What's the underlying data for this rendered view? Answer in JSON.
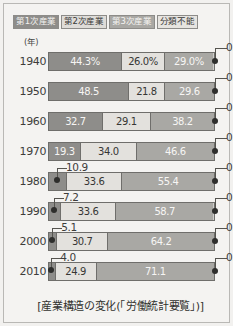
{
  "legend": {
    "items": [
      {
        "label": "第1次産業",
        "swatch_class": "sw-p1",
        "color": "#8e8d8a"
      },
      {
        "label": "第2次産業",
        "swatch_class": "sw-p2",
        "color": "#dedcd8"
      },
      {
        "label": "第3次産業",
        "swatch_class": "sw-p3",
        "color": "#a9a8a4"
      },
      {
        "label": "分類不能",
        "swatch_class": "sw-p4",
        "color": "#e6e4e0"
      }
    ]
  },
  "axis": {
    "year_unit_label": "(年)"
  },
  "caption": "[産業構造の変化(「労働統計要覧」)]",
  "chart_data": {
    "type": "bar",
    "orientation": "horizontal",
    "stacked": true,
    "normalized_percent": true,
    "title": "産業構造の変化(「労働統計要覧」)",
    "xlabel": "",
    "ylabel": "(年)",
    "xlim": [
      0,
      100
    ],
    "grid": false,
    "legend_position": "top-left",
    "categories": [
      "1940",
      "1950",
      "1960",
      "1970",
      "1980",
      "1990",
      "2000",
      "2010"
    ],
    "series": [
      {
        "name": "第1次産業",
        "color": "#8e8d8a",
        "values": [
          44.3,
          48.5,
          32.7,
          19.3,
          10.9,
          7.2,
          5.1,
          4.0
        ]
      },
      {
        "name": "第2次産業",
        "color": "#e3e1dd",
        "values": [
          26.0,
          21.8,
          29.1,
          34.0,
          33.6,
          33.6,
          30.7,
          24.9
        ]
      },
      {
        "name": "第3次産業",
        "color": "#a9a8a4",
        "values": [
          29.0,
          29.6,
          38.2,
          46.6,
          55.4,
          58.7,
          64.2,
          71.1
        ]
      },
      {
        "name": "分類不能",
        "color": "#e6e4e0",
        "values": [
          0.7,
          0.1,
          0.0,
          0.1,
          0.1,
          0.5,
          0.0,
          0.0
        ]
      }
    ],
    "rows": [
      {
        "year": "1940",
        "p1": {
          "value": 44.3,
          "label": "44.3%",
          "inside": true
        },
        "p2": {
          "value": 26.0,
          "label": "26.0%",
          "inside": true
        },
        "p3": {
          "value": 29.0,
          "label": "29.0%",
          "inside": true
        },
        "p4": {
          "value": 0.7,
          "label": "0.7",
          "callout": "right"
        }
      },
      {
        "year": "1950",
        "p1": {
          "value": 48.5,
          "label": "48.5",
          "inside": true
        },
        "p2": {
          "value": 21.8,
          "label": "21.8",
          "inside": true
        },
        "p3": {
          "value": 29.6,
          "label": "29.6",
          "inside": true
        },
        "p4": {
          "value": 0.1,
          "label": "0.1",
          "callout": "right"
        }
      },
      {
        "year": "1960",
        "p1": {
          "value": 32.7,
          "label": "32.7",
          "inside": true
        },
        "p2": {
          "value": 29.1,
          "label": "29.1",
          "inside": true
        },
        "p3": {
          "value": 38.2,
          "label": "38.2",
          "inside": true
        },
        "p4": {
          "value": 0.0,
          "label": "0.0",
          "callout": "right"
        }
      },
      {
        "year": "1970",
        "p1": {
          "value": 19.3,
          "label": "19.3",
          "inside": true
        },
        "p2": {
          "value": 34.0,
          "label": "34.0",
          "inside": true
        },
        "p3": {
          "value": 46.6,
          "label": "46.6",
          "inside": true
        },
        "p4": {
          "value": 0.1,
          "label": "0.1",
          "callout": "right"
        }
      },
      {
        "year": "1980",
        "p1": {
          "value": 10.9,
          "label": "10.9",
          "callout": "left"
        },
        "p2": {
          "value": 33.6,
          "label": "33.6",
          "inside": true
        },
        "p3": {
          "value": 55.4,
          "label": "55.4",
          "inside": true
        },
        "p4": {
          "value": 0.1,
          "label": "0.1",
          "callout": "right"
        }
      },
      {
        "year": "1990",
        "p1": {
          "value": 7.2,
          "label": "7.2",
          "callout": "left"
        },
        "p2": {
          "value": 33.6,
          "label": "33.6",
          "inside": true
        },
        "p3": {
          "value": 58.7,
          "label": "58.7",
          "inside": true
        },
        "p4": {
          "value": 0.5,
          "label": "0.5",
          "callout": "right"
        }
      },
      {
        "year": "2000",
        "p1": {
          "value": 5.1,
          "label": "5.1",
          "callout": "left"
        },
        "p2": {
          "value": 30.7,
          "label": "30.7",
          "inside": true
        },
        "p3": {
          "value": 64.2,
          "label": "64.2",
          "inside": true
        },
        "p4": {
          "value": 0.0,
          "label": "0.0",
          "callout": "right"
        }
      },
      {
        "year": "2010",
        "p1": {
          "value": 4.0,
          "label": "4.0",
          "callout": "left"
        },
        "p2": {
          "value": 24.9,
          "label": "24.9",
          "inside": true
        },
        "p3": {
          "value": 71.1,
          "label": "71.1",
          "inside": true
        },
        "p4": {
          "value": 0.0,
          "label": "0.0",
          "callout": "right"
        }
      }
    ]
  }
}
